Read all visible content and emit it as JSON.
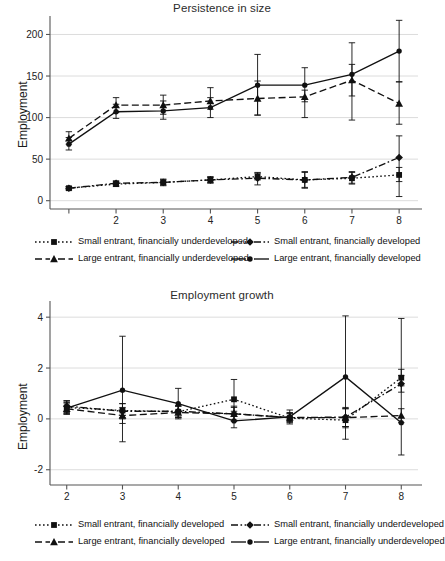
{
  "figure": {
    "background": "#ffffff",
    "ink": "#111111",
    "grid_color": "#d8d8d8",
    "axis_color": "#555555"
  },
  "chart_data": [
    {
      "id": "persistence-in-size",
      "type": "line",
      "title": "Persistence in size",
      "xlabel": "",
      "ylabel": "Employment",
      "x": [
        1,
        2,
        3,
        4,
        5,
        6,
        7,
        8
      ],
      "xticklabels": [
        "",
        "2",
        "3",
        "4",
        "5",
        "6",
        "7",
        "8"
      ],
      "xlim": [
        0.6,
        8.4
      ],
      "yticks": [
        0,
        50,
        100,
        150,
        200
      ],
      "ylim": [
        -10,
        215
      ],
      "grid": "y",
      "legend_position": "below",
      "error_bars": "95% confidence interval",
      "series": [
        {
          "name": "Small entrant, financially underdeveloped",
          "marker": "square",
          "line": "dotted",
          "values": [
            15,
            20,
            22,
            25,
            29,
            25,
            27,
            31
          ],
          "ci_low": [
            13,
            17,
            18,
            21,
            25,
            15,
            21,
            23
          ],
          "ci_high": [
            17,
            23,
            26,
            29,
            33,
            35,
            34,
            40
          ]
        },
        {
          "name": "Small entrant, financially developed",
          "marker": "diamond",
          "line": "dash-dot",
          "values": [
            15,
            21,
            22,
            25,
            27,
            25,
            28,
            52
          ],
          "ci_low": [
            13,
            18,
            19,
            22,
            19,
            16,
            20,
            5
          ],
          "ci_high": [
            17,
            24,
            25,
            28,
            34,
            34,
            35,
            78
          ]
        },
        {
          "name": "Large entrant, financially underdeveloped",
          "marker": "triangle",
          "line": "dashed",
          "values": [
            75,
            115,
            115,
            120,
            123,
            125,
            145,
            117
          ],
          "ci_low": [
            68,
            106,
            104,
            110,
            103,
            119,
            126,
            92
          ],
          "ci_high": [
            83,
            124,
            127,
            136,
            144,
            133,
            164,
            143
          ]
        },
        {
          "name": "Large entrant, financially developed",
          "marker": "circle",
          "line": "solid",
          "values": [
            68,
            107,
            108,
            112,
            139,
            139,
            152,
            180
          ],
          "ci_low": [
            61,
            99,
            98,
            100,
            103,
            100,
            97,
            143
          ],
          "ci_high": [
            76,
            116,
            120,
            124,
            176,
            160,
            190,
            217
          ]
        }
      ]
    },
    {
      "id": "employment-growth",
      "type": "line",
      "title": "Employment growth",
      "xlabel": "",
      "ylabel": "Employment",
      "x": [
        2,
        3,
        4,
        5,
        6,
        7,
        8
      ],
      "xticklabels": [
        "2",
        "3",
        "4",
        "5",
        "6",
        "7",
        "8"
      ],
      "xlim": [
        1.7,
        8.3
      ],
      "yticks": [
        -2,
        0,
        2,
        4
      ],
      "ylim": [
        -2.6,
        4.4
      ],
      "grid": "y",
      "legend_position": "below",
      "error_bars": "95% confidence interval",
      "series": [
        {
          "name": "Small entrant, financially developed",
          "marker": "square",
          "line": "dotted",
          "values": [
            0.45,
            0.33,
            0.28,
            0.77,
            0.03,
            -0.05,
            1.62
          ],
          "ci_low": [
            0.2,
            0.05,
            0.05,
            0.3,
            -0.2,
            -0.35,
            1.3
          ],
          "ci_high": [
            0.7,
            0.6,
            0.52,
            1.55,
            0.25,
            0.4,
            1.95
          ]
        },
        {
          "name": "Small entrant, financially underdeveloped",
          "marker": "diamond",
          "line": "dash-dot",
          "values": [
            0.5,
            0.3,
            0.3,
            0.2,
            0.05,
            0.07,
            1.38
          ],
          "ci_low": [
            0.25,
            0.0,
            0.08,
            -0.05,
            -0.12,
            -0.3,
            1.05
          ],
          "ci_high": [
            0.72,
            0.6,
            0.5,
            0.45,
            0.22,
            0.45,
            1.7
          ]
        },
        {
          "name": "Large entrant, financially developed",
          "marker": "triangle",
          "line": "dashed",
          "values": [
            0.4,
            0.13,
            0.25,
            0.2,
            0.05,
            0.05,
            0.13
          ],
          "ci_low": [
            0.18,
            -0.18,
            0.0,
            -0.1,
            -0.1,
            -0.3,
            -0.15
          ],
          "ci_high": [
            0.62,
            0.45,
            0.5,
            0.5,
            0.2,
            0.4,
            0.4
          ]
        },
        {
          "name": "Large entrant, financially underdeveloped",
          "marker": "circle",
          "line": "solid",
          "values": [
            0.42,
            1.13,
            0.6,
            -0.08,
            0.08,
            1.65,
            -0.15
          ],
          "ci_low": [
            0.2,
            -0.9,
            0.05,
            -0.35,
            -0.15,
            -0.8,
            -1.42
          ],
          "ci_high": [
            0.65,
            3.25,
            1.2,
            0.2,
            0.35,
            4.05,
            3.95
          ]
        }
      ]
    }
  ],
  "legends": {
    "top": [
      {
        "text": "Small entrant, financially underdeveloped",
        "key": "square-dotted"
      },
      {
        "text": "Small entrant, financially developed",
        "key": "diamond-dashdot"
      },
      {
        "text": "Large entrant, financially underdeveloped",
        "key": "triangle-dashed"
      },
      {
        "text": "Large entrant, financially developed",
        "key": "circle-solid"
      }
    ],
    "bottom": [
      {
        "text": "Small entrant, financially developed",
        "key": "square-dotted"
      },
      {
        "text": "Small entrant, financially underdeveloped",
        "key": "diamond-dashdot"
      },
      {
        "text": "Large entrant, financially developed",
        "key": "triangle-dashed"
      },
      {
        "text": "Large entrant, financially underdeveloped",
        "key": "circle-solid"
      }
    ]
  }
}
